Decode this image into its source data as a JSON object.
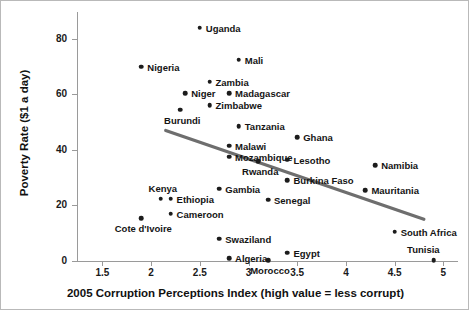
{
  "chart_data": {
    "type": "scatter",
    "title": "",
    "xlabel": "2005 Corruption Perceptions Index (high value = less corrupt)",
    "ylabel": "Poverty Rate ($1 a day)",
    "xlim": [
      1.25,
      5.15
    ],
    "ylim": [
      0,
      90
    ],
    "xticks": [
      1.5,
      2,
      2.5,
      3,
      3.5,
      4,
      4.5,
      5
    ],
    "xtick_labels": [
      "1.5",
      "2",
      "2.5",
      "3",
      "3.5",
      "4",
      "4.5",
      "5"
    ],
    "yticks": [
      0,
      20,
      40,
      60,
      80
    ],
    "ytick_labels": [
      "0",
      "20",
      "40",
      "60",
      "80"
    ],
    "grid": false,
    "legend": "none",
    "marker_color": "#1c1c1c",
    "trendline_color": "#6e6e6e",
    "axis_color": "#9a9a9a",
    "points": [
      {
        "label": "Uganda",
        "x": 2.5,
        "y": 84.0,
        "align": "right"
      },
      {
        "label": "Mali",
        "x": 2.9,
        "y": 72.5,
        "align": "right"
      },
      {
        "label": "Nigeria",
        "x": 1.9,
        "y": 70.0,
        "align": "right"
      },
      {
        "label": "Zambia",
        "x": 2.6,
        "y": 64.5,
        "align": "right"
      },
      {
        "label": "Niger",
        "x": 2.35,
        "y": 60.5,
        "align": "right"
      },
      {
        "label": "Madagascar",
        "x": 2.8,
        "y": 60.5,
        "align": "right"
      },
      {
        "label": "Zimbabwe",
        "x": 2.6,
        "y": 56.0,
        "align": "right"
      },
      {
        "label": "Burundi",
        "x": 2.3,
        "y": 54.5,
        "align": "below"
      },
      {
        "label": "Tanzania",
        "x": 2.9,
        "y": 48.5,
        "align": "right"
      },
      {
        "label": "Ghana",
        "x": 3.5,
        "y": 44.5,
        "align": "right"
      },
      {
        "label": "Malawi",
        "x": 2.8,
        "y": 41.5,
        "align": "right"
      },
      {
        "label": "Mozambique",
        "x": 2.8,
        "y": 37.5,
        "align": "right"
      },
      {
        "label": "Rwanda",
        "x": 3.1,
        "y": 36.0,
        "align": "below"
      },
      {
        "label": "Lesotho",
        "x": 3.4,
        "y": 36.5,
        "align": "right"
      },
      {
        "label": "Namibia",
        "x": 4.3,
        "y": 34.5,
        "align": "right"
      },
      {
        "label": "Burkina Faso",
        "x": 3.4,
        "y": 29.0,
        "align": "right"
      },
      {
        "label": "Gambia",
        "x": 2.7,
        "y": 26.0,
        "align": "right"
      },
      {
        "label": "Mauritania",
        "x": 4.2,
        "y": 25.5,
        "align": "right"
      },
      {
        "label": "Kenya",
        "x": 2.1,
        "y": 22.5,
        "align": "above"
      },
      {
        "label": "Ethiopia",
        "x": 2.2,
        "y": 22.5,
        "align": "right"
      },
      {
        "label": "Senegal",
        "x": 3.2,
        "y": 22.0,
        "align": "right"
      },
      {
        "label": "Cameroon",
        "x": 2.2,
        "y": 17.0,
        "align": "right"
      },
      {
        "label": "Cote d'Ivoire",
        "x": 1.9,
        "y": 15.5,
        "align": "below"
      },
      {
        "label": "South Africa",
        "x": 4.5,
        "y": 10.5,
        "align": "right"
      },
      {
        "label": "Swaziland",
        "x": 2.7,
        "y": 8.0,
        "align": "right"
      },
      {
        "label": "Egypt",
        "x": 3.4,
        "y": 3.0,
        "align": "right"
      },
      {
        "label": "Algeria",
        "x": 2.8,
        "y": 1.0,
        "align": "right"
      },
      {
        "label": "Morocco",
        "x": 3.2,
        "y": 0.3,
        "align": "below"
      },
      {
        "label": "Tunisia",
        "x": 4.9,
        "y": 0.3,
        "align": "above-left"
      }
    ],
    "trendline": {
      "x0": 2.15,
      "y0": 47.0,
      "x1": 4.8,
      "y1": 15.0
    }
  }
}
